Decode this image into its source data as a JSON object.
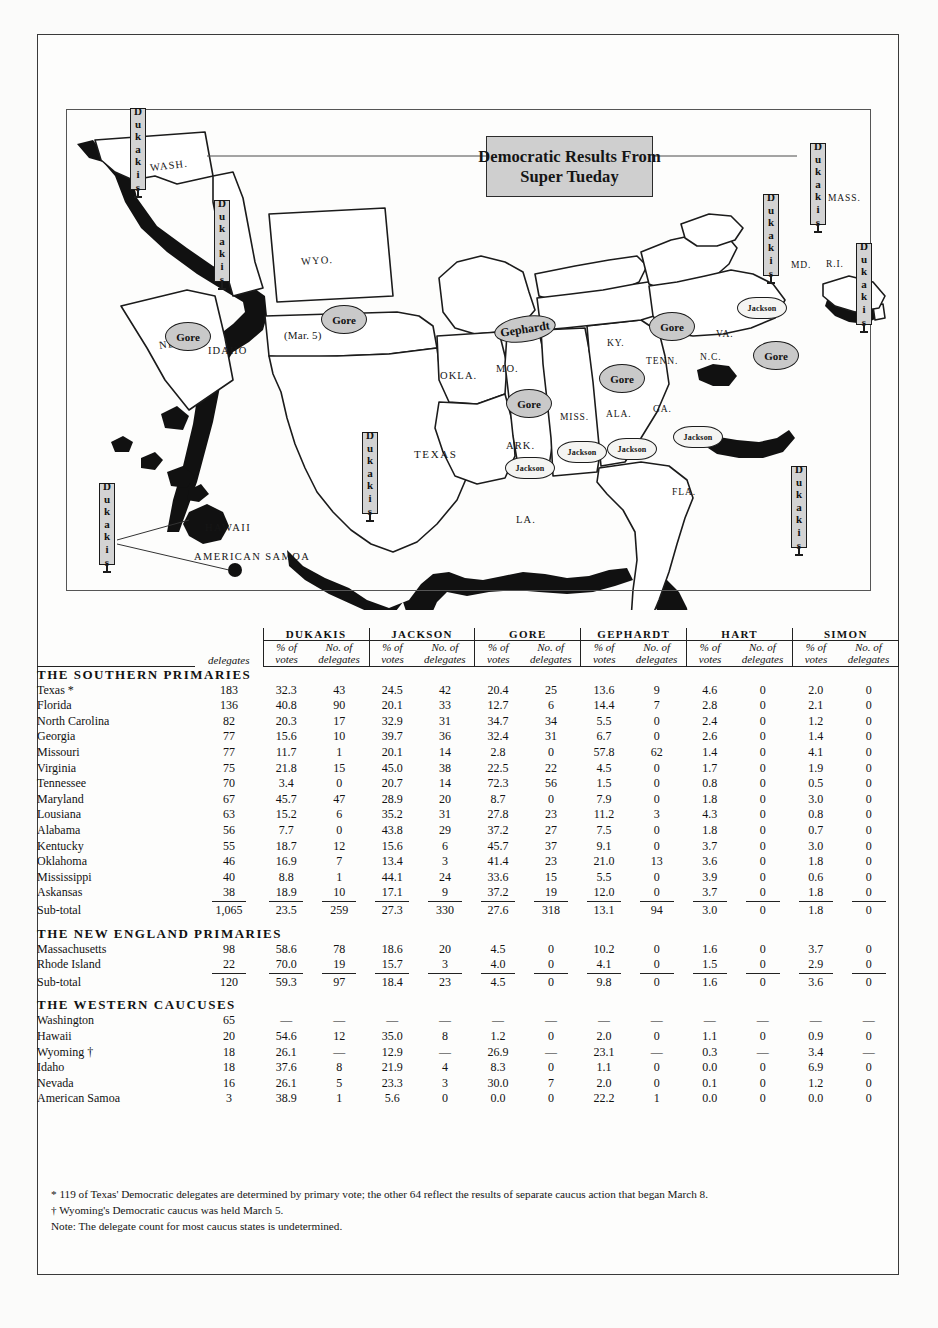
{
  "title": {
    "line1": "Democratic Results From",
    "line2": "Super Tueday"
  },
  "map": {
    "state_labels": [
      "WASH.",
      "IDAHO",
      "NEV.",
      "WYO.",
      "(Mar. 5)",
      "OKLA.",
      "MO.",
      "TEXAS",
      "ARK.",
      "LA.",
      "MISS.",
      "ALA.",
      "GA.",
      "FLA.",
      "KY.",
      "TENN.",
      "N.C.",
      "VA.",
      "MD.",
      "R.I.",
      "MASS.",
      "HAWAII",
      "AMERICAN SAMOA"
    ],
    "winner_markers": [
      {
        "label": "Gore",
        "state": "WYO."
      },
      {
        "label": "Gore",
        "state": "NEV."
      },
      {
        "label": "Gephardt",
        "state": "MO."
      },
      {
        "label": "Gore",
        "state": "OKLA."
      },
      {
        "label": "Gore",
        "state": "KY."
      },
      {
        "label": "Gore",
        "state": "TENN."
      },
      {
        "label": "Gore",
        "state": "N.C."
      },
      {
        "label": "Jackson",
        "state": "LA."
      },
      {
        "label": "Jackson",
        "state": "MISS."
      },
      {
        "label": "Jackson",
        "state": "ALA."
      },
      {
        "label": "Jackson",
        "state": "GA."
      },
      {
        "label": "Jackson",
        "state": "VA."
      },
      {
        "label": "Dukakis",
        "state": "WASH."
      },
      {
        "label": "Dukakis",
        "state": "IDAHO"
      },
      {
        "label": "Dukakis",
        "state": "TEXAS"
      },
      {
        "label": "Dukakis",
        "state": "FLA."
      },
      {
        "label": "Dukakis",
        "state": "MD."
      },
      {
        "label": "Dukakis",
        "state": "MASS."
      },
      {
        "label": "Dukakis",
        "state": "R.I."
      },
      {
        "label": "Dukakis",
        "state": "HAWAII"
      }
    ]
  },
  "table": {
    "candidates": [
      "DUKAKIS",
      "JACKSON",
      "GORE",
      "GEPHARDT",
      "HART",
      "SIMON"
    ],
    "sub_headers": {
      "pct_top": "% of",
      "pct_bot": "votes",
      "del_top": "No. of",
      "del_bot": "delegates"
    },
    "delegates_col": "delegates",
    "sections": [
      {
        "heading": "THE SOUTHERN PRIMARIES",
        "rows": [
          {
            "state": "Texas *",
            "delegates": "183",
            "v": [
              "32.3",
              "43",
              "24.5",
              "42",
              "20.4",
              "25",
              "13.6",
              "9",
              "4.6",
              "0",
              "2.0",
              "0"
            ]
          },
          {
            "state": "Florida",
            "delegates": "136",
            "v": [
              "40.8",
              "90",
              "20.1",
              "33",
              "12.7",
              "6",
              "14.4",
              "7",
              "2.8",
              "0",
              "2.1",
              "0"
            ]
          },
          {
            "state": "North Carolina",
            "delegates": "82",
            "v": [
              "20.3",
              "17",
              "32.9",
              "31",
              "34.7",
              "34",
              "5.5",
              "0",
              "2.4",
              "0",
              "1.2",
              "0"
            ]
          },
          {
            "state": "Georgia",
            "delegates": "77",
            "v": [
              "15.6",
              "10",
              "39.7",
              "36",
              "32.4",
              "31",
              "6.7",
              "0",
              "2.6",
              "0",
              "1.4",
              "0"
            ]
          },
          {
            "state": "Missouri",
            "delegates": "77",
            "v": [
              "11.7",
              "1",
              "20.1",
              "14",
              "2.8",
              "0",
              "57.8",
              "62",
              "1.4",
              "0",
              "4.1",
              "0"
            ]
          },
          {
            "state": "Virginia",
            "delegates": "75",
            "v": [
              "21.8",
              "15",
              "45.0",
              "38",
              "22.5",
              "22",
              "4.5",
              "0",
              "1.7",
              "0",
              "1.9",
              "0"
            ]
          },
          {
            "state": "Tennessee",
            "delegates": "70",
            "v": [
              "3.4",
              "0",
              "20.7",
              "14",
              "72.3",
              "56",
              "1.5",
              "0",
              "0.8",
              "0",
              "0.5",
              "0"
            ]
          },
          {
            "state": "Maryland",
            "delegates": "67",
            "v": [
              "45.7",
              "47",
              "28.9",
              "20",
              "8.7",
              "0",
              "7.9",
              "0",
              "1.8",
              "0",
              "3.0",
              "0"
            ]
          },
          {
            "state": "Lousiana",
            "delegates": "63",
            "v": [
              "15.2",
              "6",
              "35.2",
              "31",
              "27.8",
              "23",
              "11.2",
              "3",
              "4.3",
              "0",
              "0.8",
              "0"
            ]
          },
          {
            "state": "Alabama",
            "delegates": "56",
            "v": [
              "7.7",
              "0",
              "43.8",
              "29",
              "37.2",
              "27",
              "7.5",
              "0",
              "1.8",
              "0",
              "0.7",
              "0"
            ]
          },
          {
            "state": "Kentucky",
            "delegates": "55",
            "v": [
              "18.7",
              "12",
              "15.6",
              "6",
              "45.7",
              "37",
              "9.1",
              "0",
              "3.7",
              "0",
              "3.0",
              "0"
            ]
          },
          {
            "state": "Oklahoma",
            "delegates": "46",
            "v": [
              "16.9",
              "7",
              "13.4",
              "3",
              "41.4",
              "23",
              "21.0",
              "13",
              "3.6",
              "0",
              "1.8",
              "0"
            ]
          },
          {
            "state": "Mississippi",
            "delegates": "40",
            "v": [
              "8.8",
              "1",
              "44.1",
              "24",
              "33.6",
              "15",
              "5.5",
              "0",
              "3.9",
              "0",
              "0.6",
              "0"
            ]
          },
          {
            "state": "Askansas",
            "delegates": "38",
            "v": [
              "18.9",
              "10",
              "17.1",
              "9",
              "37.2",
              "19",
              "12.0",
              "0",
              "3.7",
              "0",
              "1.8",
              "0"
            ]
          }
        ],
        "subtotal": {
          "label": "Sub-total",
          "delegates": "1,065",
          "v": [
            "23.5",
            "259",
            "27.3",
            "330",
            "27.6",
            "318",
            "13.1",
            "94",
            "3.0",
            "0",
            "1.8",
            "0"
          ]
        }
      },
      {
        "heading": "THE NEW ENGLAND PRIMARIES",
        "rows": [
          {
            "state": "Massachusetts",
            "delegates": "98",
            "v": [
              "58.6",
              "78",
              "18.6",
              "20",
              "4.5",
              "0",
              "10.2",
              "0",
              "1.6",
              "0",
              "3.7",
              "0"
            ]
          },
          {
            "state": "Rhode Island",
            "delegates": "22",
            "v": [
              "70.0",
              "19",
              "15.7",
              "3",
              "4.0",
              "0",
              "4.1",
              "0",
              "1.5",
              "0",
              "2.9",
              "0"
            ]
          }
        ],
        "subtotal": {
          "label": "Sub-total",
          "delegates": "120",
          "v": [
            "59.3",
            "97",
            "18.4",
            "23",
            "4.5",
            "0",
            "9.8",
            "0",
            "1.6",
            "0",
            "3.6",
            "0"
          ]
        }
      },
      {
        "heading": "THE WESTERN CAUCUSES",
        "rows": [
          {
            "state": "Washington",
            "delegates": "65",
            "v": [
              "—",
              "—",
              "—",
              "—",
              "—",
              "—",
              "—",
              "—",
              "—",
              "—",
              "—",
              "—"
            ]
          },
          {
            "state": "Hawaii",
            "delegates": "20",
            "v": [
              "54.6",
              "12",
              "35.0",
              "8",
              "1.2",
              "0",
              "2.0",
              "0",
              "1.1",
              "0",
              "0.9",
              "0"
            ]
          },
          {
            "state": "Wyoming †",
            "delegates": "18",
            "v": [
              "26.1",
              "—",
              "12.9",
              "—",
              "26.9",
              "—",
              "23.1",
              "—",
              "0.3",
              "—",
              "3.4",
              "—"
            ]
          },
          {
            "state": "Idaho",
            "delegates": "18",
            "v": [
              "37.6",
              "8",
              "21.9",
              "4",
              "8.3",
              "0",
              "1.1",
              "0",
              "0.0",
              "0",
              "6.9",
              "0"
            ]
          },
          {
            "state": "Nevada",
            "delegates": "16",
            "v": [
              "26.1",
              "5",
              "23.3",
              "3",
              "30.0",
              "7",
              "2.0",
              "0",
              "0.1",
              "0",
              "1.2",
              "0"
            ]
          },
          {
            "state": "American Samoa",
            "delegates": "3",
            "v": [
              "38.9",
              "1",
              "5.6",
              "0",
              "0.0",
              "0",
              "22.2",
              "1",
              "0.0",
              "0",
              "0.0",
              "0"
            ]
          }
        ],
        "subtotal": null
      }
    ]
  },
  "footnotes": [
    "* 119 of Texas' Democratic delegates are determined by primary vote; the other 64 reflect the results of separate caucus action that began March 8.",
    "† Wyoming's Democratic caucus was held March 5.",
    "Note: The delegate count for most caucus states is undetermined."
  ],
  "colors": {
    "pill_fill": "#c9c9c9",
    "banner_fill": "#d3d3d3",
    "title_fill": "#cfcfcf",
    "ink": "#111111"
  }
}
